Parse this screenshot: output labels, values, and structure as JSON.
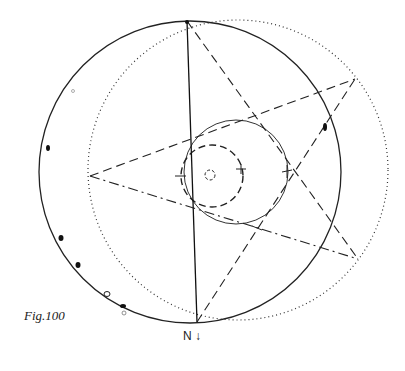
{
  "figure": {
    "caption": "Fig.100",
    "north_label": "N",
    "north_arrow": "↓"
  },
  "diagram": {
    "type": "stereographic-projection",
    "primitive_circle": {
      "cx": 190,
      "cy": 172,
      "r": 151,
      "style": "solid"
    },
    "dotted_circle": {
      "cx": 238,
      "cy": 170,
      "r": 150,
      "style": "dotted"
    },
    "small_circle": {
      "cx": 236,
      "cy": 172,
      "r": 52,
      "style": "solid"
    },
    "dashed_circle": {
      "cx": 212,
      "cy": 176,
      "r": 31,
      "style": "dashed"
    },
    "tiny_circle": {
      "cx": 210,
      "cy": 175,
      "r": 5,
      "style": "dashed"
    },
    "vertical_diameter": {
      "x1": 187,
      "y1": 21,
      "x2": 197,
      "y2": 322
    },
    "points": {
      "top": [
        187,
        21
      ],
      "upper_right": [
        355,
        79
      ],
      "left": [
        90,
        176
      ],
      "lower_right": [
        358,
        259
      ],
      "bottom": [
        197,
        322
      ]
    },
    "markers_on_primitive": [
      [
        48,
        148
      ],
      [
        61,
        238
      ],
      [
        78,
        265
      ],
      [
        123,
        306
      ]
    ],
    "open_marker": [
      107,
      294
    ]
  }
}
